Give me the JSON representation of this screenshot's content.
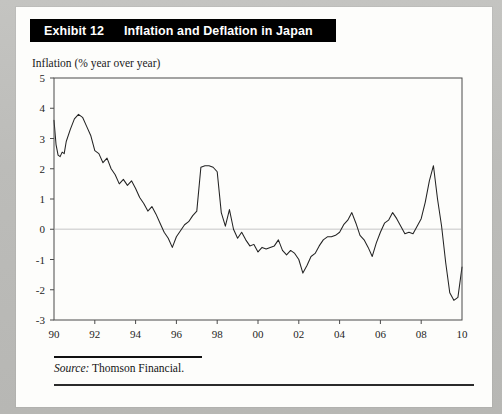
{
  "exhibit": {
    "number": "Exhibit 12",
    "title": "Inflation and Deflation in Japan"
  },
  "axis_caption": "Inflation (% year over year)",
  "source": {
    "label": "Source:",
    "text": "Thomson Financial."
  },
  "colors": {
    "header_bg": "#000000",
    "header_text": "#ffffff",
    "paper": "#fdfdfb",
    "page_surround": "#bfbfbc",
    "series_line": "#232323",
    "zero_line": "#d6d6d6",
    "frame": "#4a4a4a"
  },
  "chart_data": {
    "type": "line",
    "title": "Inflation and Deflation in Japan",
    "xlabel": "",
    "ylabel": "Inflation (% year over year)",
    "xlim": [
      1990,
      2010
    ],
    "ylim": [
      -3,
      5
    ],
    "ytick_labels": [
      "5",
      "4",
      "3",
      "2",
      "1",
      "0",
      "-1",
      "-2",
      "-3"
    ],
    "yticks": [
      5,
      4,
      3,
      2,
      1,
      0,
      -1,
      -2,
      -3
    ],
    "xtick_labels": [
      "90",
      "92",
      "94",
      "96",
      "98",
      "00",
      "02",
      "04",
      "06",
      "08",
      "10"
    ],
    "xticks": [
      1990,
      1992,
      1994,
      1996,
      1998,
      2000,
      2002,
      2004,
      2006,
      2008,
      2010
    ],
    "grid": false,
    "legend": "none",
    "zero_reference_line": 0,
    "series": [
      {
        "name": "Japan CPI inflation (% year over year)",
        "x": [
          1990.0,
          1990.1,
          1990.2,
          1990.3,
          1990.4,
          1990.5,
          1990.6,
          1990.8,
          1991.0,
          1991.2,
          1991.4,
          1991.6,
          1991.8,
          1992.0,
          1992.2,
          1992.4,
          1992.6,
          1992.8,
          1993.0,
          1993.2,
          1993.4,
          1993.6,
          1993.8,
          1994.0,
          1994.2,
          1994.4,
          1994.6,
          1994.8,
          1995.0,
          1995.2,
          1995.4,
          1995.6,
          1995.8,
          1996.0,
          1996.2,
          1996.4,
          1996.6,
          1996.8,
          1997.0,
          1997.2,
          1997.4,
          1997.6,
          1997.8,
          1998.0,
          1998.2,
          1998.4,
          1998.6,
          1998.8,
          1999.0,
          1999.2,
          1999.4,
          1999.6,
          1999.8,
          2000.0,
          2000.2,
          2000.4,
          2000.6,
          2000.8,
          2001.0,
          2001.2,
          2001.4,
          2001.6,
          2001.8,
          2002.0,
          2002.2,
          2002.4,
          2002.6,
          2002.8,
          2003.0,
          2003.2,
          2003.4,
          2003.6,
          2003.8,
          2004.0,
          2004.2,
          2004.4,
          2004.6,
          2004.8,
          2005.0,
          2005.2,
          2005.4,
          2005.6,
          2005.8,
          2006.0,
          2006.2,
          2006.4,
          2006.6,
          2006.8,
          2007.0,
          2007.2,
          2007.4,
          2007.6,
          2007.8,
          2008.0,
          2008.2,
          2008.4,
          2008.6,
          2008.8,
          2009.0,
          2009.2,
          2009.4,
          2009.6,
          2009.8,
          2010.0
        ],
        "values": [
          3.6,
          2.8,
          2.45,
          2.4,
          2.55,
          2.5,
          2.9,
          3.3,
          3.65,
          3.8,
          3.7,
          3.4,
          3.1,
          2.6,
          2.5,
          2.2,
          2.35,
          2.0,
          1.8,
          1.5,
          1.65,
          1.45,
          1.6,
          1.35,
          1.05,
          0.85,
          0.6,
          0.75,
          0.5,
          0.2,
          -0.1,
          -0.3,
          -0.6,
          -0.25,
          -0.05,
          0.15,
          0.25,
          0.45,
          0.6,
          2.05,
          2.1,
          2.1,
          2.05,
          1.9,
          0.55,
          0.1,
          0.65,
          0.0,
          -0.3,
          -0.1,
          -0.35,
          -0.55,
          -0.5,
          -0.75,
          -0.6,
          -0.65,
          -0.6,
          -0.55,
          -0.35,
          -0.7,
          -0.85,
          -0.7,
          -0.8,
          -1.0,
          -1.45,
          -1.2,
          -0.9,
          -0.8,
          -0.55,
          -0.35,
          -0.25,
          -0.25,
          -0.2,
          -0.1,
          0.15,
          0.3,
          0.55,
          0.2,
          -0.2,
          -0.35,
          -0.6,
          -0.9,
          -0.45,
          -0.1,
          0.2,
          0.3,
          0.55,
          0.35,
          0.1,
          -0.15,
          -0.1,
          -0.15,
          0.1,
          0.35,
          0.9,
          1.6,
          2.1,
          1.0,
          0.1,
          -1.1,
          -2.1,
          -2.35,
          -2.25,
          -1.25
        ]
      }
    ]
  }
}
